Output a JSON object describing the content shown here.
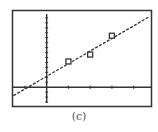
{
  "figure": {
    "caption": "(c)"
  },
  "chart_data": {
    "type": "scatter",
    "title": "",
    "xlabel": "",
    "ylabel": "",
    "grid": false,
    "legend": null,
    "screen_style": "graphing-calculator",
    "xlim": [
      -1.55,
      4.8
    ],
    "ylim": [
      -3.8,
      15.4
    ],
    "x_tick_step": 1,
    "y_tick_step": 1,
    "tick_labels": "none",
    "series": [
      {
        "name": "data points",
        "marker": "open-square",
        "points": [
          {
            "x": 1,
            "y": 5.2
          },
          {
            "x": 2,
            "y": 6.6
          },
          {
            "x": 3,
            "y": 10.4
          }
        ]
      },
      {
        "name": "regression line",
        "style": "dashed",
        "slope": 2.55,
        "intercept": 2.2
      }
    ]
  },
  "colors": {
    "frame": "#333333",
    "axis": "#333333",
    "line": "#333333",
    "background": "#ffffff"
  }
}
